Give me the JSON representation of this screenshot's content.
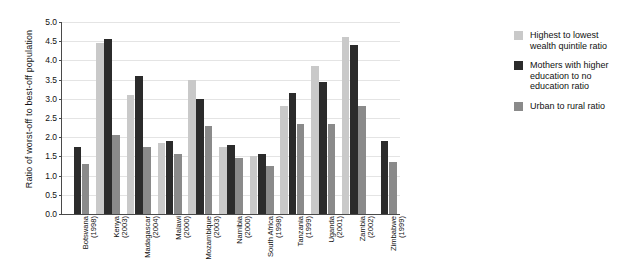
{
  "chart_data": {
    "type": "bar",
    "title": "",
    "xlabel": "",
    "ylabel": "Ratio of worst-off to best-off population",
    "ylim": [
      0.0,
      5.0
    ],
    "ytick_step": 0.5,
    "grid": true,
    "legend_position": "right",
    "yticks": [
      "5.0",
      "4.5",
      "4.0",
      "3.5",
      "3.0",
      "2.5",
      "2.0",
      "1.5",
      "1.0",
      "0.5",
      "0.0"
    ],
    "categories": [
      {
        "name": "Botswana",
        "year": "(1998)"
      },
      {
        "name": "Kenya",
        "year": "(2003)"
      },
      {
        "name": "Madagascar",
        "year": "(2004)"
      },
      {
        "name": "Malawi",
        "year": "(2000)"
      },
      {
        "name": "Mozambique",
        "year": "(2003)"
      },
      {
        "name": "Namibia",
        "year": "(2000)"
      },
      {
        "name": "South Africa",
        "year": "(1998)"
      },
      {
        "name": "Tanzania",
        "year": "(1999)"
      },
      {
        "name": "Uganda",
        "year": "(2001)"
      },
      {
        "name": "Zambia",
        "year": "(2002)"
      },
      {
        "name": "Zimbabwe",
        "year": "(1999)"
      }
    ],
    "series": [
      {
        "name": "Highest to lowest wealth quintile ratio",
        "color": "#c9c9c9",
        "values": [
          null,
          4.45,
          3.1,
          1.85,
          3.5,
          1.75,
          1.5,
          2.8,
          3.85,
          4.6,
          null
        ]
      },
      {
        "name": "Mothers with higher education to no education ratio",
        "color": "#2b2b2b",
        "values": [
          1.75,
          4.55,
          3.6,
          1.9,
          3.0,
          1.8,
          1.55,
          3.15,
          3.45,
          4.4,
          1.9
        ]
      },
      {
        "name": "Urban to rural ratio",
        "color": "#8a8a8a",
        "values": [
          1.3,
          2.05,
          1.75,
          1.55,
          2.3,
          1.45,
          1.25,
          2.35,
          2.35,
          2.8,
          1.35
        ]
      }
    ]
  },
  "legend": {
    "items": [
      {
        "label": "Highest to lowest wealth quintile ratio",
        "swatch": "c0"
      },
      {
        "label": "Mothers with higher education to no education ratio",
        "swatch": "c1"
      },
      {
        "label": "Urban to rural ratio",
        "swatch": "c2"
      }
    ]
  }
}
